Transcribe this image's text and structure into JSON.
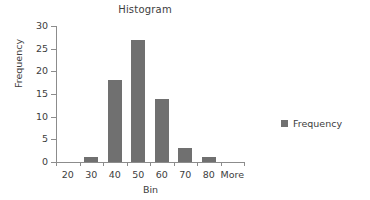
{
  "chart_data": {
    "type": "bar",
    "title": "Histogram",
    "xlabel": "Bin",
    "ylabel": "Frequency",
    "categories": [
      "20",
      "30",
      "40",
      "50",
      "60",
      "70",
      "80",
      "More"
    ],
    "values": [
      0,
      1,
      18,
      27,
      14,
      3,
      1,
      0
    ],
    "series": [
      {
        "name": "Frequency",
        "values": [
          0,
          1,
          18,
          27,
          14,
          3,
          1,
          0
        ]
      }
    ],
    "ylim": [
      0,
      30
    ],
    "ytick_labels": [
      "0",
      "5",
      "10",
      "15",
      "20",
      "25",
      "30"
    ],
    "ytick_values": [
      0,
      5,
      10,
      15,
      20,
      25,
      30
    ],
    "ystep": 5,
    "grid": false,
    "legend_position": "right",
    "legend_entries": [
      "Frequency"
    ],
    "bar_color": "#707070",
    "axis_color": "#8c8c8c",
    "text_color": "#3d3d3d",
    "background": "#ffffff"
  }
}
